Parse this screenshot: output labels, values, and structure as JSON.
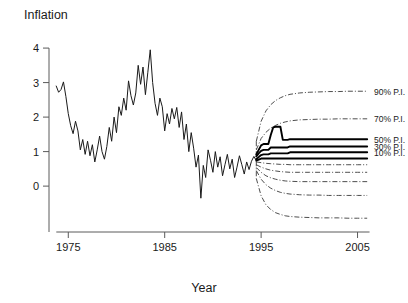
{
  "chart_data": {
    "type": "line",
    "title": "",
    "ylabel": "Inflation",
    "xlabel": "Year",
    "xlim": [
      1973.0,
      2006.5
    ],
    "ylim": [
      -0.75,
      4.35
    ],
    "grid": false,
    "legend_position": "right",
    "xticks": [
      1975,
      1985,
      1995,
      2005
    ],
    "xticklabels": [
      "1975",
      "1985",
      "1995",
      "2005"
    ],
    "yticks": [
      0,
      1,
      2,
      3,
      4
    ],
    "yticklabels": [
      "0",
      "1",
      "2",
      "3",
      "4"
    ],
    "legend": [
      {
        "label": "90% P.I.",
        "value": 90
      },
      {
        "label": "70% P.I.",
        "value": 70
      },
      {
        "label": "50% P.I.",
        "value": 50
      },
      {
        "label": "30% P.I.",
        "value": 30
      },
      {
        "label": "10% P.I.",
        "value": 10
      }
    ],
    "series": [
      {
        "name": "Historical inflation",
        "style": "solid-thin",
        "x": [
          1973.75,
          1974.0,
          1974.25,
          1974.5,
          1974.75,
          1975.0,
          1975.25,
          1975.5,
          1975.75,
          1976.0,
          1976.25,
          1976.5,
          1976.75,
          1977.0,
          1977.25,
          1977.5,
          1977.75,
          1978.0,
          1978.25,
          1978.5,
          1978.75,
          1979.0,
          1979.25,
          1979.5,
          1979.75,
          1980.0,
          1980.25,
          1980.5,
          1980.75,
          1981.0,
          1981.25,
          1981.5,
          1981.75,
          1982.0,
          1982.25,
          1982.5,
          1982.75,
          1983.0,
          1983.25,
          1983.5,
          1983.75,
          1984.0,
          1984.25,
          1984.5,
          1984.75,
          1985.0,
          1985.25,
          1985.5,
          1985.75,
          1986.0,
          1986.25,
          1986.5,
          1986.75,
          1987.0,
          1987.25,
          1987.5,
          1987.75,
          1988.0,
          1988.25,
          1988.5,
          1988.75,
          1989.0,
          1989.25,
          1989.5,
          1989.75,
          1990.0,
          1990.25,
          1990.5,
          1990.75,
          1991.0,
          1991.25,
          1991.5,
          1991.75,
          1992.0,
          1992.25,
          1992.5,
          1992.75,
          1993.0,
          1993.25,
          1993.5,
          1993.75,
          1994.0,
          1994.25,
          1994.5
        ],
        "y": [
          2.9,
          2.72,
          2.8,
          3.02,
          2.6,
          2.1,
          1.75,
          1.52,
          1.88,
          1.6,
          1.05,
          1.35,
          0.92,
          1.3,
          0.88,
          1.2,
          0.7,
          1.05,
          1.45,
          1.0,
          0.78,
          1.15,
          1.7,
          1.3,
          2.0,
          1.55,
          2.3,
          2.05,
          2.55,
          2.2,
          3.05,
          2.62,
          2.35,
          2.7,
          3.5,
          2.95,
          3.45,
          2.65,
          3.3,
          3.95,
          3.0,
          2.4,
          2.05,
          2.55,
          2.3,
          1.6,
          2.1,
          1.8,
          2.25,
          1.95,
          2.28,
          1.7,
          2.15,
          1.35,
          1.8,
          1.0,
          1.55,
          1.1,
          0.55,
          0.9,
          -0.35,
          0.6,
          0.25,
          1.05,
          0.75,
          0.4,
          1.0,
          0.55,
          0.85,
          0.3,
          0.62,
          0.92,
          0.5,
          0.78,
          0.25,
          0.55,
          0.88,
          0.62,
          0.35,
          0.7,
          0.48,
          0.72,
          0.86,
          0.74
        ]
      },
      {
        "name": "Central forecast (median)",
        "style": "solid-thick",
        "x": [
          1994.5,
          1995.0,
          1995.25,
          1995.5,
          1995.75,
          1996.0,
          1996.25,
          1996.5,
          1996.75,
          1997.0,
          1997.25,
          1997.5,
          1997.75,
          1998.0,
          1998.5,
          1999.0,
          1999.5,
          2000.0,
          2000.5,
          2001.0,
          2001.5,
          2002.0,
          2002.5,
          2003.0,
          2003.5,
          2004.0,
          2004.5,
          2005.0,
          2005.5,
          2006.0
        ],
        "y": [
          0.74,
          0.8,
          0.8,
          0.8,
          0.8,
          0.8,
          0.8,
          0.8,
          0.8,
          0.8,
          0.8,
          0.8,
          0.8,
          0.8,
          0.8,
          0.8,
          0.8,
          0.8,
          0.8,
          0.8,
          0.8,
          0.8,
          0.8,
          0.8,
          0.8,
          0.8,
          0.8,
          0.8,
          0.8,
          0.8
        ]
      },
      {
        "name": "10% P.I. upper",
        "style": "solid-thick",
        "x": [
          1994.5,
          1994.75,
          1995.0,
          1995.25,
          1995.5,
          1995.75,
          1996.0,
          1996.25,
          1996.5,
          1996.75,
          1997.0,
          1997.25,
          1997.5,
          1997.75,
          1998.0,
          1998.5,
          1999.0,
          1999.5,
          2000.0,
          2000.5,
          2001.0,
          2001.5,
          2002.0,
          2002.5,
          2003.0,
          2003.5,
          2004.0,
          2004.5,
          2005.0,
          2005.5,
          2006.0
        ],
        "y": [
          0.78,
          0.84,
          0.9,
          0.92,
          0.92,
          0.92,
          0.95,
          0.95,
          0.95,
          0.95,
          0.95,
          0.95,
          0.95,
          0.95,
          0.98,
          0.98,
          0.98,
          0.98,
          0.98,
          0.98,
          0.98,
          0.98,
          0.98,
          0.98,
          0.98,
          0.98,
          0.98,
          0.98,
          0.98,
          0.98,
          0.98
        ]
      },
      {
        "name": "30% P.I. upper",
        "style": "solid-thick",
        "x": [
          1994.5,
          1994.75,
          1995.0,
          1995.25,
          1995.5,
          1995.75,
          1996.0,
          1996.25,
          1996.5,
          1996.75,
          1997.0,
          1997.25,
          1997.5,
          1997.75,
          1998.0,
          1998.5,
          1999.0,
          1999.5,
          2000.0,
          2000.5,
          2001.0,
          2001.5,
          2002.0,
          2002.5,
          2003.0,
          2003.5,
          2004.0,
          2004.5,
          2005.0,
          2005.5,
          2006.0
        ],
        "y": [
          0.86,
          0.95,
          1.02,
          1.05,
          1.05,
          1.05,
          1.12,
          1.12,
          1.12,
          1.12,
          1.12,
          1.12,
          1.12,
          1.12,
          1.15,
          1.15,
          1.15,
          1.15,
          1.15,
          1.15,
          1.15,
          1.15,
          1.15,
          1.15,
          1.15,
          1.15,
          1.15,
          1.15,
          1.15,
          1.15,
          1.15
        ]
      },
      {
        "name": "50% P.I. upper",
        "style": "solid-thick",
        "x": [
          1994.5,
          1994.75,
          1995.0,
          1995.25,
          1995.5,
          1995.75,
          1996.0,
          1996.25,
          1996.5,
          1996.75,
          1997.0,
          1997.25,
          1997.5,
          1997.75,
          1998.0,
          1998.5,
          1999.0,
          1999.5,
          2000.0,
          2000.5,
          2001.0,
          2001.5,
          2002.0,
          2002.5,
          2003.0,
          2003.5,
          2004.0,
          2004.5,
          2005.0,
          2005.5,
          2006.0
        ],
        "y": [
          0.92,
          1.05,
          1.18,
          1.22,
          1.22,
          1.22,
          1.48,
          1.7,
          1.72,
          1.72,
          1.72,
          1.34,
          1.34,
          1.34,
          1.36,
          1.36,
          1.36,
          1.36,
          1.36,
          1.36,
          1.36,
          1.36,
          1.36,
          1.36,
          1.36,
          1.36,
          1.36,
          1.36,
          1.36,
          1.36,
          1.36
        ]
      },
      {
        "name": "10% P.I. lower",
        "style": "dashdot",
        "x": [
          1994.5,
          1995.0,
          1995.5,
          1996.0,
          1996.5,
          1997.0,
          1997.5,
          1998.0,
          1999.0,
          2000.0,
          2001.0,
          2002.0,
          2003.0,
          2004.0,
          2005.0,
          2006.0
        ],
        "y": [
          0.7,
          0.68,
          0.66,
          0.65,
          0.64,
          0.63,
          0.63,
          0.62,
          0.62,
          0.62,
          0.62,
          0.62,
          0.62,
          0.62,
          0.62,
          0.62
        ]
      },
      {
        "name": "30% P.I. lower",
        "style": "dashdot",
        "x": [
          1994.5,
          1995.0,
          1995.5,
          1996.0,
          1996.5,
          1997.0,
          1997.5,
          1998.0,
          1999.0,
          2000.0,
          2001.0,
          2002.0,
          2003.0,
          2004.0,
          2005.0,
          2006.0
        ],
        "y": [
          0.62,
          0.55,
          0.5,
          0.46,
          0.44,
          0.42,
          0.41,
          0.4,
          0.4,
          0.4,
          0.4,
          0.4,
          0.4,
          0.4,
          0.4,
          0.4
        ]
      },
      {
        "name": "50% P.I. lower",
        "style": "dashdot",
        "x": [
          1994.5,
          1995.0,
          1995.5,
          1996.0,
          1996.5,
          1997.0,
          1997.5,
          1998.0,
          1999.0,
          2000.0,
          2001.0,
          2002.0,
          2003.0,
          2004.0,
          2005.0,
          2006.0
        ],
        "y": [
          0.54,
          0.4,
          0.3,
          0.24,
          0.2,
          0.17,
          0.15,
          0.14,
          0.13,
          0.13,
          0.13,
          0.13,
          0.13,
          0.13,
          0.13,
          0.13
        ]
      },
      {
        "name": "70% P.I. upper",
        "style": "dashdot",
        "x": [
          1994.5,
          1995.0,
          1995.5,
          1996.0,
          1996.5,
          1997.0,
          1997.5,
          1998.0,
          1999.0,
          2000.0,
          2001.0,
          2002.0,
          2003.0,
          2004.0,
          2005.0,
          2006.0
        ],
        "y": [
          1.05,
          1.38,
          1.56,
          1.68,
          1.76,
          1.82,
          1.86,
          1.89,
          1.92,
          1.93,
          1.94,
          1.94,
          1.95,
          1.95,
          1.95,
          1.95
        ]
      },
      {
        "name": "70% P.I. lower",
        "style": "dashdot",
        "x": [
          1994.5,
          1995.0,
          1995.5,
          1996.0,
          1996.5,
          1997.0,
          1997.5,
          1998.0,
          1999.0,
          2000.0,
          2001.0,
          2002.0,
          2003.0,
          2004.0,
          2005.0,
          2006.0
        ],
        "y": [
          0.45,
          0.2,
          0.04,
          -0.06,
          -0.13,
          -0.18,
          -0.21,
          -0.23,
          -0.25,
          -0.26,
          -0.26,
          -0.27,
          -0.27,
          -0.27,
          -0.27,
          -0.27
        ]
      },
      {
        "name": "90% P.I. upper",
        "style": "dashdot",
        "x": [
          1994.5,
          1995.0,
          1995.5,
          1996.0,
          1996.5,
          1997.0,
          1997.5,
          1998.0,
          1999.0,
          2000.0,
          2001.0,
          2002.0,
          2003.0,
          2004.0,
          2005.0,
          2006.0
        ],
        "y": [
          1.3,
          1.88,
          2.18,
          2.36,
          2.48,
          2.56,
          2.62,
          2.66,
          2.7,
          2.72,
          2.73,
          2.74,
          2.74,
          2.75,
          2.75,
          2.75
        ]
      },
      {
        "name": "90% P.I. lower",
        "style": "dashdot",
        "x": [
          1994.5,
          1995.0,
          1995.5,
          1996.0,
          1996.5,
          1997.0,
          1997.5,
          1998.0,
          1999.0,
          2000.0,
          2001.0,
          2002.0,
          2003.0,
          2004.0,
          2005.0,
          2006.0
        ],
        "y": [
          0.22,
          -0.28,
          -0.54,
          -0.68,
          -0.77,
          -0.82,
          -0.86,
          -0.88,
          -0.9,
          -0.91,
          -0.92,
          -0.92,
          -0.92,
          -0.93,
          -0.93,
          -0.93
        ]
      }
    ]
  }
}
